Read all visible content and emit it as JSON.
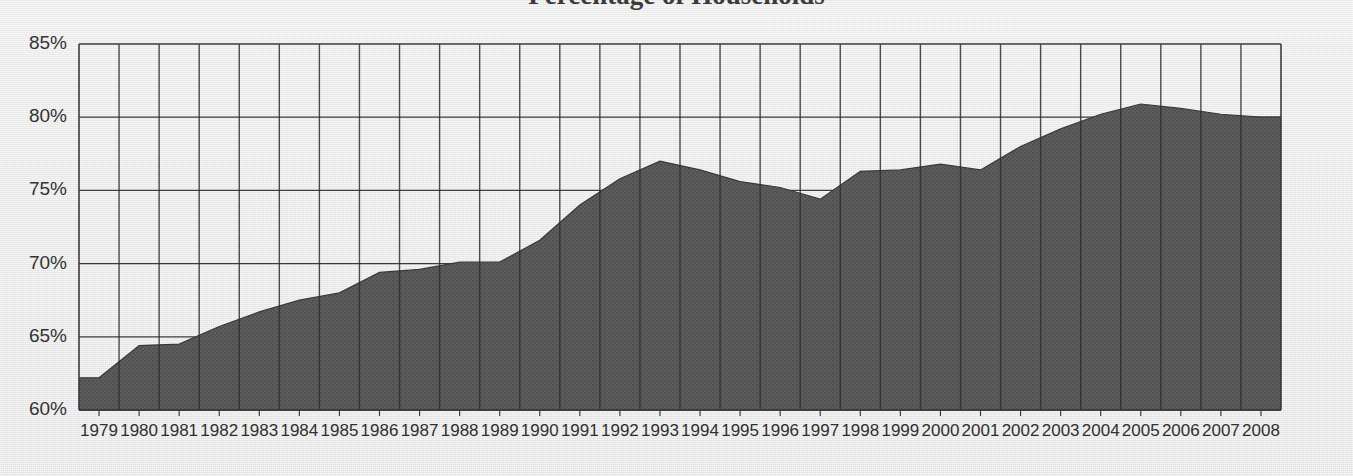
{
  "page": {
    "background_color": "#e9e9e9",
    "clipped_title_fragment": "Percentage of Households"
  },
  "chart_data": {
    "type": "area",
    "title": "",
    "xlabel": "",
    "ylabel": "",
    "ylim": [
      60,
      85
    ],
    "ytick_step": 5,
    "grid": true,
    "legend": "none",
    "series_color": "#5a5a5a",
    "axis_color": "#3d3d3d",
    "ytick_labels": [
      "85%",
      "80%",
      "75%",
      "70%",
      "65%",
      "60%"
    ],
    "yticks": [
      85,
      80,
      75,
      70,
      65,
      60
    ],
    "categories": [
      "1979",
      "1980",
      "1981",
      "1982",
      "1983",
      "1984",
      "1985",
      "1986",
      "1987",
      "1988",
      "1989",
      "1990",
      "1991",
      "1992",
      "1993",
      "1994",
      "1995",
      "1996",
      "1997",
      "1998",
      "1999",
      "2000",
      "2001",
      "2002",
      "2003",
      "2004",
      "2005",
      "2006",
      "2007",
      "2008"
    ],
    "values": [
      62.2,
      64.4,
      64.5,
      65.7,
      66.7,
      67.5,
      68.0,
      69.4,
      69.6,
      70.1,
      70.1,
      71.6,
      74.0,
      75.8,
      77.0,
      76.4,
      75.6,
      75.2,
      74.4,
      76.3,
      76.4,
      76.8,
      76.4,
      78.0,
      79.2,
      80.2,
      80.9,
      80.6,
      80.2,
      80.0
    ],
    "series": [
      {
        "name": "Percentage",
        "values": [
          62.2,
          64.4,
          64.5,
          65.7,
          66.7,
          67.5,
          68.0,
          69.4,
          69.6,
          70.1,
          70.1,
          71.6,
          74.0,
          75.8,
          77.0,
          76.4,
          75.6,
          75.2,
          74.4,
          76.3,
          76.4,
          76.8,
          76.4,
          78.0,
          79.2,
          80.2,
          80.9,
          80.6,
          80.2,
          80.0
        ]
      }
    ],
    "annotations": {
      "minimum_label": "62.2% (1979)",
      "maximum_label": "80.9% (2005)",
      "local_peak_label": "77.0% (1993)",
      "local_trough_label": "74.4% (1997)",
      "final_label": "80.0% (2008)"
    }
  }
}
